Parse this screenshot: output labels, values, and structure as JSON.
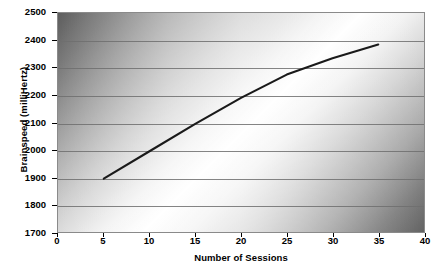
{
  "chart_data": {
    "type": "line",
    "title": "",
    "xlabel": "Number of Sessions",
    "ylabel": "Brainspeed (milliHertz)",
    "xlim": [
      0,
      40
    ],
    "ylim": [
      1700,
      2500
    ],
    "xticks": [
      0,
      5,
      10,
      15,
      20,
      25,
      30,
      35,
      40
    ],
    "yticks": [
      1700,
      1800,
      1900,
      2000,
      2100,
      2200,
      2300,
      2400,
      2500
    ],
    "grid": true,
    "legend": false,
    "legend_position": "none",
    "series": [
      {
        "name": "Brainspeed",
        "color": "#1a1a1a",
        "x": [
          5,
          10,
          15,
          20,
          25,
          30,
          35
        ],
        "values": [
          1895,
          1995,
          2095,
          2190,
          2275,
          2335,
          2385
        ]
      }
    ]
  },
  "axes": {
    "y_title": "Brainspeed (milliHertz)",
    "x_title": "Number of Sessions",
    "y_tick_labels": [
      "2500",
      "2400",
      "2300",
      "2200",
      "2100",
      "2000",
      "1900",
      "1800",
      "1700"
    ],
    "x_tick_labels": [
      "0",
      "5",
      "10",
      "15",
      "20",
      "25",
      "30",
      "35",
      "40"
    ]
  },
  "colors": {
    "line": "#1a1a1a",
    "grid": "#6f6f6f",
    "border": "#8a8a8a",
    "text": "#000000",
    "plot_dark": "#5d5d5d",
    "plot_light": "#ffffff"
  }
}
